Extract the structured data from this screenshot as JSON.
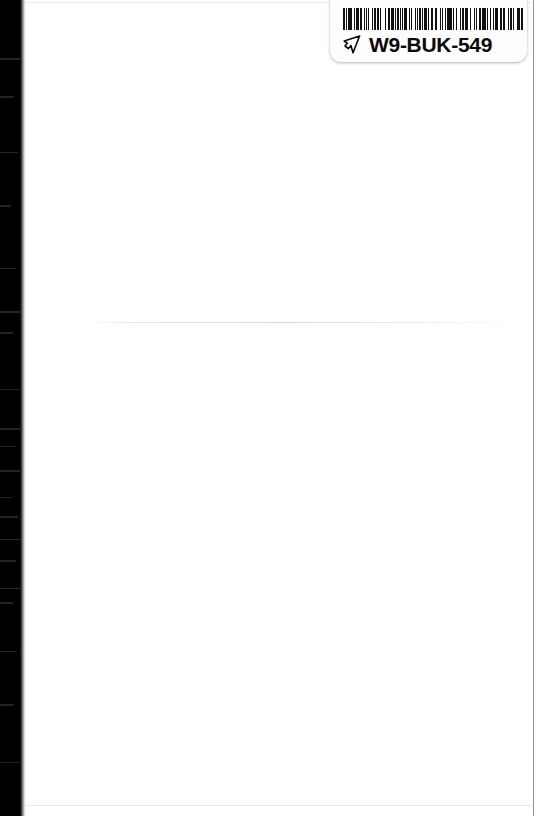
{
  "page": {
    "kind": "scanned-book-page",
    "background_color": "#ffffff",
    "width": 536,
    "height": 816,
    "content_text": ""
  },
  "binding_shadow": {
    "name": "scanner-binding-shadow",
    "color": "#000000",
    "edge": "left",
    "width_px": 22,
    "streaks": [
      {
        "top": 58,
        "width": 20,
        "height": 2
      },
      {
        "top": 96,
        "width": 14,
        "height": 2
      },
      {
        "top": 152,
        "width": 18,
        "height": 1
      },
      {
        "top": 205,
        "width": 11,
        "height": 2
      },
      {
        "top": 268,
        "width": 16,
        "height": 1
      },
      {
        "top": 311,
        "width": 21,
        "height": 2
      },
      {
        "top": 332,
        "width": 13,
        "height": 2
      },
      {
        "top": 389,
        "width": 19,
        "height": 1
      },
      {
        "top": 428,
        "width": 22,
        "height": 2
      },
      {
        "top": 446,
        "width": 15,
        "height": 1
      },
      {
        "top": 470,
        "width": 20,
        "height": 2
      },
      {
        "top": 497,
        "width": 12,
        "height": 1
      },
      {
        "top": 516,
        "width": 18,
        "height": 2
      },
      {
        "top": 539,
        "width": 21,
        "height": 1
      },
      {
        "top": 560,
        "width": 16,
        "height": 2
      },
      {
        "top": 588,
        "width": 22,
        "height": 1
      },
      {
        "top": 602,
        "width": 13,
        "height": 2
      },
      {
        "top": 651,
        "width": 17,
        "height": 1
      },
      {
        "top": 704,
        "width": 14,
        "height": 2
      },
      {
        "top": 762,
        "width": 19,
        "height": 1
      }
    ]
  },
  "crease_line": {
    "name": "page-crease-line",
    "top_px": 322
  },
  "sticker": {
    "label": "barcode-sticker",
    "background_color": "#fdfdfd",
    "code_text": "W9-BUK-549",
    "pointer_icon": "pointing-hand-icon",
    "barcode": {
      "symbology": "code-128",
      "encoded_value": "W9-BUK-549",
      "foreground_color": "#111111",
      "background_color": "#ffffff",
      "bar_widths": [
        2,
        1,
        1,
        1,
        3,
        1,
        1,
        2,
        1,
        1,
        3,
        1,
        2,
        2,
        1,
        1,
        1,
        2,
        1,
        3,
        1,
        1,
        2,
        1,
        2,
        1,
        1,
        3,
        1,
        1,
        1,
        2,
        2,
        1,
        3,
        1,
        1,
        1,
        2,
        1,
        1,
        2,
        1,
        1,
        3,
        2,
        1,
        1,
        1,
        3,
        1,
        1,
        2,
        1,
        2,
        1,
        1,
        1,
        3,
        1,
        1,
        2,
        2,
        1,
        1,
        1,
        2,
        3,
        1,
        1,
        1,
        2,
        1,
        1,
        3,
        1,
        2,
        1,
        1,
        2,
        1,
        3,
        1,
        1,
        2,
        1,
        1,
        1,
        2,
        2,
        1,
        3,
        1,
        1,
        1,
        2,
        2,
        1,
        1,
        1,
        3,
        1,
        1,
        2,
        1,
        2,
        1,
        1,
        3,
        1,
        1,
        1,
        2,
        1,
        2,
        3,
        1,
        1,
        2,
        1,
        1,
        2,
        1,
        1,
        3,
        1,
        2,
        1
      ]
    }
  }
}
